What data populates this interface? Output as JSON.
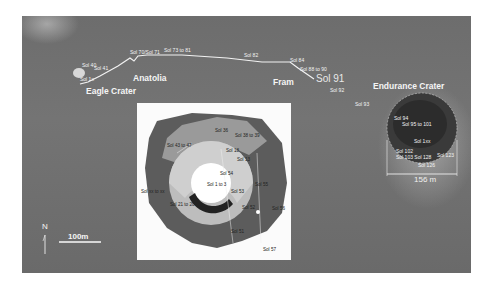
{
  "map": {
    "places": {
      "eagle_crater": "Eagle Crater",
      "anatolia": "Anatolia",
      "fram": "Fram",
      "endurance_crater": "Endurance Crater"
    },
    "traverse_labels": {
      "sol_40": "Sol 40",
      "sol_41": "Sol 41",
      "sol_1x": "Sol 1x",
      "sol_70_71": "Sol 70/Sol 71",
      "sol_73_to_81": "Sol 73 to 81",
      "sol_82": "Sol 82",
      "sol_84": "Sol 84",
      "sol_88_to_90": "Sol 88 to 90",
      "sol_91": "Sol 91",
      "sol_92": "Sol 92",
      "sol_93": "Sol 93"
    },
    "endurance_labels": {
      "sol_94": "Sol 94",
      "sol_95_to_101": "Sol 95 to 101",
      "sol_1xx": "Sol 1xx",
      "sol_102": "Sol 102",
      "sol_103_sol_128": "Sol 103 Sol 128",
      "sol_123": "Sol 123",
      "sol_126": "Sol 126"
    },
    "crater_diameter": "156 m",
    "scale_bar": "100m",
    "north": "N"
  },
  "inset": {
    "labels": {
      "sol_36": "Sol 36",
      "sol_38_to_39": "Sol 38 to 39",
      "sol_43_to_47": "Sol 43 to 47",
      "sol_18": "Sol 18",
      "sol_13": "Sol 13",
      "sol_54": "Sol 54",
      "sol_1_to_3": "Sol 1 to 3",
      "sol_53": "Sol 53",
      "sol_55": "Sol 55",
      "sol_xx_to_xx": "Sol xx to xx",
      "sol_21_to_20": "Sol 21 to 20",
      "sol_52": "Sol 52",
      "sol_56": "Sol 56",
      "sol_51": "Sol 51",
      "sol_57": "Sol 57"
    }
  },
  "colors": {
    "terrain": "#6f6f6f",
    "path": "#f0f0f0",
    "inset_bg": "#fbfbfb"
  }
}
